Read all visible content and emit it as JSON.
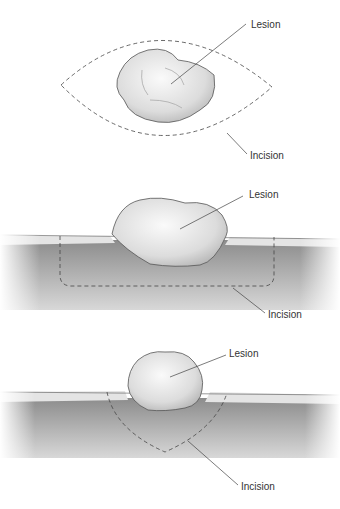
{
  "panels": [
    {
      "id": "top-view",
      "labels": {
        "lesion": "Lesion",
        "incision": "Incision"
      }
    },
    {
      "id": "rectangular-section",
      "labels": {
        "lesion": "Lesion",
        "incision": "Incision"
      }
    },
    {
      "id": "v-section",
      "labels": {
        "lesion": "Lesion",
        "incision": "Incision"
      }
    }
  ],
  "colors": {
    "line": "#444444",
    "tissue": "#9a9a9a",
    "lesion": "#e6e6e6",
    "label": "#333333"
  }
}
